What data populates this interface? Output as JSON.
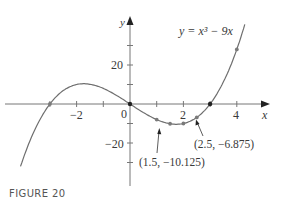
{
  "figure": {
    "caption": "FIGURE 20",
    "equation_label": "y = x³ − 9x",
    "x_axis_label": "x",
    "y_axis_label": "y",
    "origin_label": "0",
    "x_tick_labels": [
      "−2",
      "2",
      "4"
    ],
    "y_tick_labels": [
      "20",
      "−20"
    ],
    "annotations": [
      "(1.5, −10.125)",
      "(2.5, −6.875)"
    ]
  },
  "chart_data": {
    "type": "line",
    "title": "",
    "function": "y = x^3 - 9x",
    "xlabel": "x",
    "ylabel": "y",
    "xlim": [
      -4.1,
      4.3
    ],
    "ylim": [
      -35,
      42
    ],
    "x_ticks": [
      -3,
      -2,
      -1,
      0,
      1,
      2,
      3,
      4
    ],
    "x_tick_labels_shown": [
      -2,
      2,
      4
    ],
    "y_ticks": [
      -30,
      -20,
      -10,
      10,
      20,
      30
    ],
    "y_tick_labels_shown": [
      20,
      -20
    ],
    "grid": false,
    "marked_points": [
      {
        "x": -3,
        "y": 0
      },
      {
        "x": 0,
        "y": 0
      },
      {
        "x": 1,
        "y": -8
      },
      {
        "x": 1.5,
        "y": -10.125
      },
      {
        "x": 2,
        "y": -10
      },
      {
        "x": 2.5,
        "y": -6.875
      },
      {
        "x": 3,
        "y": 0
      },
      {
        "x": 4,
        "y": 28
      }
    ],
    "annotations": [
      {
        "text": "(1.5, −10.125)",
        "x": 1.5,
        "y": -10.125
      },
      {
        "text": "(2.5, −6.875)",
        "x": 2.5,
        "y": -6.875
      }
    ],
    "caption": "FIGURE 20"
  }
}
